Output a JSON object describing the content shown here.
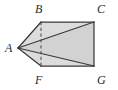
{
  "figure": {
    "kind": "geometry-solid-diagram",
    "canvas": {
      "width": 118,
      "height": 90
    },
    "colors": {
      "fill": "#d6d6d6",
      "fill_front": "#d0d0d0",
      "stroke": "#3a3a3a",
      "hidden_stroke": "#5a5a5a",
      "label": "#2b2b2b",
      "background": "#ffffff"
    },
    "vertices": [
      {
        "id": "A",
        "label": "A",
        "x": 18,
        "y": 48,
        "label_x": 5,
        "label_y": 42
      },
      {
        "id": "B",
        "label": "B",
        "x": 41,
        "y": 22,
        "label_x": 35,
        "label_y": 3
      },
      {
        "id": "C",
        "label": "C",
        "x": 94,
        "y": 22,
        "label_x": 97,
        "label_y": 3
      },
      {
        "id": "F",
        "label": "F",
        "x": 41,
        "y": 66,
        "label_x": 35,
        "label_y": 74
      },
      {
        "id": "G",
        "label": "G",
        "x": 94,
        "y": 66,
        "label_x": 97,
        "label_y": 74
      }
    ],
    "edges": [
      {
        "from": "A",
        "to": "B",
        "style": "solid"
      },
      {
        "from": "A",
        "to": "C",
        "style": "solid"
      },
      {
        "from": "A",
        "to": "F",
        "style": "solid"
      },
      {
        "from": "A",
        "to": "G",
        "style": "solid"
      },
      {
        "from": "B",
        "to": "C",
        "style": "solid"
      },
      {
        "from": "C",
        "to": "G",
        "style": "solid"
      },
      {
        "from": "F",
        "to": "G",
        "style": "solid"
      },
      {
        "from": "B",
        "to": "F",
        "style": "dashed"
      }
    ],
    "faces": [
      {
        "id": "face-top",
        "points": "18,48 41,22 94,22"
      },
      {
        "id": "face-bottom",
        "points": "18,48 41,66 94,66"
      },
      {
        "id": "face-front",
        "points": "18,48 94,22 94,66"
      },
      {
        "id": "face-rect",
        "points": "41,22 94,22 94,66 41,66"
      }
    ]
  }
}
